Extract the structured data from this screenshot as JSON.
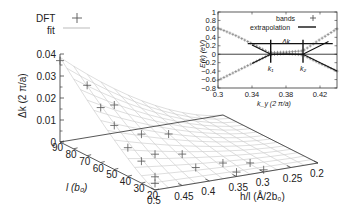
{
  "chart_data": [
    {
      "type": "scatter",
      "subtype": "3d-surface-with-points",
      "title": "",
      "legend": {
        "placement": "top-left",
        "entries": [
          {
            "label": "DFT",
            "marker": "plus"
          },
          {
            "label": "fit",
            "marker": "line"
          }
        ]
      },
      "zlabel": "Δk (2 π/a)",
      "ylabel": "l (b₀)",
      "xlabel": "h/l (Å/2b₀)",
      "zlim": [
        0,
        0.04
      ],
      "ylim": [
        20,
        90
      ],
      "xlim": [
        0.2,
        0.5
      ],
      "z_ticks": [
        "0",
        "0.01",
        "0.02",
        "0.03",
        "0.04"
      ],
      "y_ticks": [
        "90",
        "80",
        "70",
        "60",
        "50",
        "40",
        "30",
        "20"
      ],
      "x_ticks": [
        "0.5",
        "0.45",
        "0.4",
        "0.35",
        "0.3",
        "0.25",
        "0.2"
      ],
      "grid_h_values": [
        0.2,
        0.25,
        0.3,
        0.35,
        0.4,
        0.45,
        0.5
      ],
      "grid_l_values": [
        20,
        30,
        40,
        50,
        60,
        70,
        80,
        90
      ],
      "dft_points": [
        {
          "l": 90,
          "h": 0.5,
          "dk": 0.037
        },
        {
          "l": 70,
          "h": 0.5,
          "dk": 0.032
        },
        {
          "l": 60,
          "h": 0.5,
          "dk": 0.025
        },
        {
          "l": 50,
          "h": 0.5,
          "dk": 0.02
        },
        {
          "l": 40,
          "h": 0.5,
          "dk": 0.013
        },
        {
          "l": 30,
          "h": 0.5,
          "dk": 0.01
        },
        {
          "l": 20,
          "h": 0.5,
          "dk": 0.006
        },
        {
          "l": 20,
          "h": 0.5,
          "dk": 0.003
        },
        {
          "l": 70,
          "h": 0.45,
          "dk": 0.021
        },
        {
          "l": 50,
          "h": 0.45,
          "dk": 0.014
        },
        {
          "l": 40,
          "h": 0.45,
          "dk": 0.008
        },
        {
          "l": 50,
          "h": 0.4,
          "dk": 0.012
        },
        {
          "l": 40,
          "h": 0.4,
          "dk": 0.006
        },
        {
          "l": 30,
          "h": 0.4,
          "dk": 0.003
        },
        {
          "l": 30,
          "h": 0.35,
          "dk": 0.003
        },
        {
          "l": 20,
          "h": 0.35,
          "dk": 0.002
        },
        {
          "l": 20,
          "h": 0.3,
          "dk": 0.001
        },
        {
          "l": 30,
          "h": 0.3,
          "dk": 0.001
        }
      ]
    },
    {
      "type": "line",
      "placement": "top-right inset",
      "xlabel": "k_y (2 π/a)",
      "ylabel": "E(k) (eV)",
      "xlim": [
        0.3,
        0.44
      ],
      "ylim": [
        -0.8,
        1.0
      ],
      "x_ticks": [
        "0.3",
        "0.34",
        "0.38",
        "0.42"
      ],
      "y_ticks": [
        "1",
        "0.8",
        "0.6",
        "0.4",
        "0.2",
        "0",
        "-0.2",
        "-0.4",
        "-0.6",
        "-0.8"
      ],
      "legend": {
        "placement": "top-right",
        "entries": [
          {
            "label": "bands",
            "marker": "plus"
          },
          {
            "label": "extrapolation",
            "marker": "line"
          }
        ]
      },
      "annotations": [
        {
          "text": "Δk",
          "x": 0.38,
          "y": 0.3
        },
        {
          "text": "k₁",
          "x": 0.362,
          "y": -0.35
        },
        {
          "text": "k₂",
          "x": 0.4,
          "y": -0.35
        }
      ],
      "k1": 0.362,
      "k2": 0.4,
      "delta_k_arrow_y": 0.25,
      "series": [
        {
          "name": "bands upper",
          "x": [
            0.3,
            0.32,
            0.34,
            0.36,
            0.38,
            0.4,
            0.42,
            0.44
          ],
          "y": [
            0.62,
            0.45,
            0.25,
            0.04,
            0.05,
            0.08,
            0.35,
            0.6
          ]
        },
        {
          "name": "bands lower",
          "x": [
            0.3,
            0.32,
            0.34,
            0.36,
            0.38,
            0.4,
            0.42,
            0.44
          ],
          "y": [
            -0.62,
            -0.42,
            -0.22,
            -0.02,
            0.02,
            -0.02,
            -0.22,
            -0.4
          ]
        },
        {
          "name": "extrapolation upper",
          "x": [
            0.34,
            0.362,
            0.4,
            0.43
          ],
          "y": [
            0.22,
            0.0,
            0.0,
            0.3
          ]
        },
        {
          "name": "extrapolation lower",
          "x": [
            0.34,
            0.362,
            0.4,
            0.44
          ],
          "y": [
            -0.22,
            0.0,
            0.0,
            -0.4
          ]
        }
      ]
    }
  ]
}
